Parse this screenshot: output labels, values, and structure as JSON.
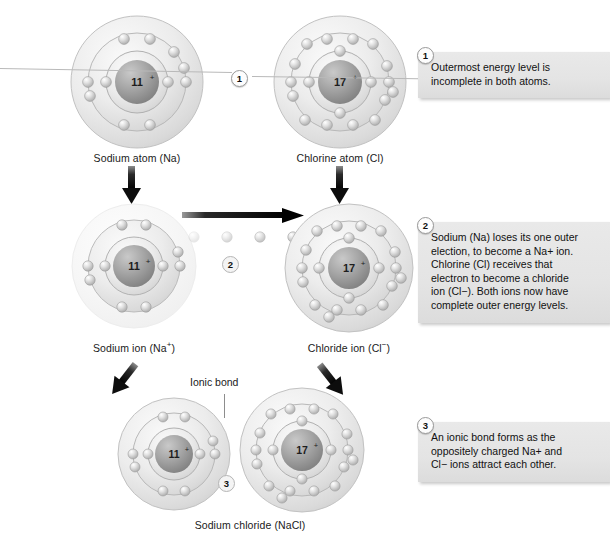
{
  "figure": {
    "background": "#ffffff"
  },
  "atoms": {
    "sodium_atom": {
      "nucleus_label": "11",
      "nucleus_charge": "+",
      "caption": "Sodium atom (Na)",
      "shells": [
        2,
        8,
        1
      ],
      "element": "Na",
      "protons": 11
    },
    "chlorine_atom": {
      "nucleus_label": "17",
      "nucleus_charge": "+",
      "caption": "Chlorine atom (Cl)",
      "shells": [
        2,
        8,
        7
      ],
      "element": "Cl",
      "protons": 17
    },
    "sodium_ion": {
      "nucleus_label": "11",
      "nucleus_charge": "+",
      "caption_text": "Sodium ion (Na",
      "caption_sup": "+",
      "caption_tail": ")",
      "caption": "Sodium ion (Na+)",
      "shells": [
        2,
        8
      ],
      "element": "Na+",
      "protons": 11
    },
    "chloride_ion": {
      "nucleus_label": "17",
      "nucleus_charge": "+",
      "caption_text": "Chloride ion (Cl",
      "caption_sup": "−",
      "caption_tail": ")",
      "caption": "Chloride ion (Cl−)",
      "shells": [
        2,
        8,
        8
      ],
      "element": "Cl-",
      "protons": 17
    },
    "nacl_sodium": {
      "nucleus_label": "11",
      "nucleus_charge": "+",
      "shells": [
        2,
        8
      ],
      "protons": 11
    },
    "nacl_chlorine": {
      "nucleus_label": "17",
      "nucleus_charge": "+",
      "shells": [
        2,
        8,
        8
      ],
      "protons": 17
    }
  },
  "labels": {
    "ionic_bond": "Ionic bond",
    "sodium_chloride": "Sodium chloride (NaCl)"
  },
  "steps": [
    {
      "number": "1",
      "text": "Outermost energy level is incomplete in both atoms."
    },
    {
      "number": "2",
      "text": "Sodium (Na) loses its one outer election, to become a Na+ ion. Chlorine (Cl) receives that electron to become a chloride ion (Cl−). Both ions now have complete outer energy levels.",
      "lines": [
        "Sodium (Na) loses its one outer",
        "election, to become a Na+ ion.",
        "Chlorine (Cl) receives that",
        "electron to become a chloride",
        "ion (Cl−). Both ions now have",
        "complete outer energy levels."
      ]
    },
    {
      "number": "3",
      "text": "An ionic bond forms as the oppositely charged Na+ and Cl− ions attract each other.",
      "lines": [
        "An ionic bond forms as the",
        "oppositely charged Na+ and",
        "Cl− ions attract each other."
      ]
    }
  ],
  "markers": {
    "step1_inline": "1",
    "step2_inline": "2",
    "step3_inline": "3"
  },
  "transfer": {
    "electron_count": 4,
    "description": "electron transferred from sodium to chlorine"
  },
  "colors": {
    "shell_light": "#f2f2f2",
    "shell_mid": "#dcdcdc",
    "shell_edge": "#b0b0b0",
    "nucleus_dark": "#8f8f8f",
    "electron": "#d8d8d8",
    "callout_bg": "#e6e6e6",
    "text": "#1a1a1a",
    "arrow": "#111111"
  }
}
